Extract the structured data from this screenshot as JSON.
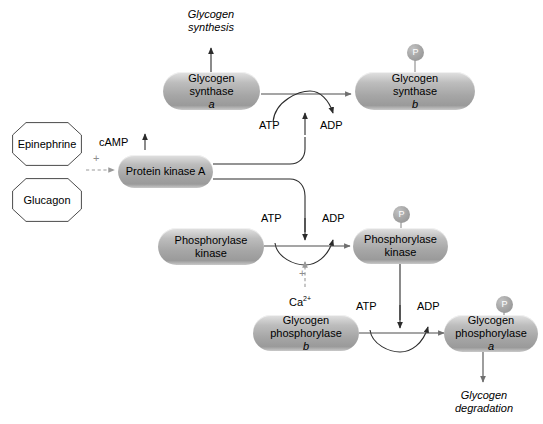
{
  "diagram": {
    "type": "biochemical-pathway",
    "colors": {
      "node_fill_light": "#e2e2e2",
      "node_fill_dark": "#9a9a9a",
      "phosphate_fill": "#a8a8a8",
      "phosphate_text": "#ffffff",
      "line": "#3a3a3a",
      "dashed_line": "#9a9a9a",
      "plus_sign": "#8d8d8d",
      "background": "#ffffff",
      "text": "#000000"
    }
  },
  "hormones": [
    {
      "id": "epinephrine",
      "label": "Epinephrine",
      "shape": "octagon"
    },
    {
      "id": "glucagon",
      "label": "Glucagon",
      "shape": "octagon"
    }
  ],
  "messenger": {
    "label": "cAMP",
    "arrow": "↑",
    "meaning": "increase"
  },
  "activation_sign": "+",
  "calcium": {
    "label": "Ca",
    "charge": "2+",
    "sign": "+"
  },
  "nodes": [
    {
      "id": "protein-kinase-a",
      "line1": "Protein kinase A",
      "line2": "",
      "italic_suffix": "",
      "phosphate": false
    },
    {
      "id": "glycogen-synthase-a",
      "line1": "Glycogen",
      "line2": "synthase ",
      "italic_suffix": "a",
      "phosphate": false
    },
    {
      "id": "glycogen-synthase-b",
      "line1": "Glycogen",
      "line2": "synthase ",
      "italic_suffix": "b",
      "phosphate": true
    },
    {
      "id": "phosphorylase-kinase-inactive",
      "line1": "Phosphorylase",
      "line2": "kinase",
      "italic_suffix": "",
      "phosphate": false
    },
    {
      "id": "phosphorylase-kinase-active",
      "line1": "Phosphorylase",
      "line2": "kinase",
      "italic_suffix": "",
      "phosphate": true
    },
    {
      "id": "glycogen-phosphorylase-b",
      "line1": "Glycogen",
      "line2": "phosphorylase ",
      "italic_suffix": "b",
      "phosphate": false
    },
    {
      "id": "glycogen-phosphorylase-a",
      "line1": "Glycogen",
      "line2": "phosphorylase ",
      "italic_suffix": "a",
      "phosphate": true
    }
  ],
  "phosphate_label": "P",
  "cofactors": [
    {
      "id": "atp-top",
      "label": "ATP"
    },
    {
      "id": "adp-top",
      "label": "ADP"
    },
    {
      "id": "atp-middle",
      "label": "ATP"
    },
    {
      "id": "adp-middle",
      "label": "ADP"
    },
    {
      "id": "atp-bottom",
      "label": "ATP"
    },
    {
      "id": "adp-bottom",
      "label": "ADP"
    }
  ],
  "outcomes": [
    {
      "id": "glycogen-synthesis",
      "line1": "Glycogen",
      "line2": "synthesis"
    },
    {
      "id": "glycogen-degradation",
      "line1": "Glycogen",
      "line2": "degradation"
    }
  ]
}
